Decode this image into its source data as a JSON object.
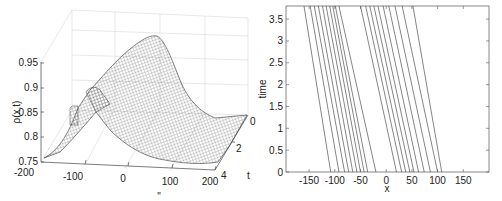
{
  "chart_data": [
    {
      "type": "surface",
      "title": "",
      "xlabel": "x",
      "ylabel": "t",
      "zlabel": "ρ(x,t)",
      "x_ticks": [
        "-200",
        "-100",
        "0",
        "100",
        "200"
      ],
      "t_ticks": [
        "0",
        "2",
        "4"
      ],
      "z_ticks": [
        "0.75",
        "0.8",
        "0.85",
        "0.9",
        "0.95"
      ],
      "xlim": [
        -200,
        200
      ],
      "tlim": [
        0,
        4
      ],
      "zlim": [
        0.75,
        0.95
      ],
      "description": "Mesh surface of density rho(x,t): a traveling hump with peak ~0.95 moving toward negative x as t increases; baseline ~0.75-0.78"
    },
    {
      "type": "line",
      "title": "",
      "xlabel": "x",
      "ylabel": "time",
      "xlim": [
        -195,
        200
      ],
      "ylim": [
        0,
        3.8
      ],
      "x_ticks": [
        "-150",
        "-100",
        "-50",
        "0",
        "50",
        "100",
        "150"
      ],
      "y_ticks": [
        "0",
        "0.5",
        "1",
        "1.5",
        "2",
        "2.5",
        "3",
        "3.5"
      ],
      "grid": false,
      "series": [
        {
          "name": "trajectory 1",
          "x": [
            -108,
            -160
          ],
          "t": [
            0,
            3.8
          ]
        },
        {
          "name": "trajectory 2",
          "x": [
            -92,
            -148
          ],
          "t": [
            0,
            3.8
          ]
        },
        {
          "name": "trajectory 3",
          "x": [
            -81,
            -140
          ],
          "t": [
            0,
            3.8
          ]
        },
        {
          "name": "trajectory 4",
          "x": [
            -73,
            -132
          ],
          "t": [
            0,
            3.8
          ]
        },
        {
          "name": "trajectory 5",
          "x": [
            -65,
            -124
          ],
          "t": [
            0,
            3.8
          ]
        },
        {
          "name": "trajectory 6",
          "x": [
            -57,
            -117
          ],
          "t": [
            0,
            3.8
          ]
        },
        {
          "name": "trajectory 7",
          "x": [
            -50,
            -110
          ],
          "t": [
            0,
            3.8
          ]
        },
        {
          "name": "trajectory 8",
          "x": [
            -43,
            -104
          ],
          "t": [
            0,
            3.8
          ]
        },
        {
          "name": "trajectory 9",
          "x": [
            -36,
            -99
          ],
          "t": [
            0,
            3.8
          ]
        },
        {
          "name": "trajectory 10",
          "x": [
            -20,
            -92
          ],
          "t": [
            0,
            3.8
          ]
        },
        {
          "name": "trajectory 11",
          "x": [
            20,
            -50
          ],
          "t": [
            0,
            3.8
          ]
        },
        {
          "name": "trajectory 12",
          "x": [
            30,
            -40
          ],
          "t": [
            0,
            3.8
          ]
        },
        {
          "name": "trajectory 13",
          "x": [
            38,
            -32
          ],
          "t": [
            0,
            3.8
          ]
        },
        {
          "name": "trajectory 14",
          "x": [
            46,
            -24
          ],
          "t": [
            0,
            3.8
          ]
        },
        {
          "name": "trajectory 15",
          "x": [
            54,
            -16
          ],
          "t": [
            0,
            3.8
          ]
        },
        {
          "name": "trajectory 16",
          "x": [
            63,
            -6
          ],
          "t": [
            0,
            3.8
          ]
        },
        {
          "name": "trajectory 17",
          "x": [
            74,
            5
          ],
          "t": [
            0,
            3.8
          ]
        },
        {
          "name": "trajectory 18",
          "x": [
            86,
            17
          ],
          "t": [
            0,
            3.8
          ]
        },
        {
          "name": "trajectory 19",
          "x": [
            100,
            31
          ],
          "t": [
            0,
            3.8
          ]
        },
        {
          "name": "trajectory 20",
          "x": [
            108,
            52
          ],
          "t": [
            0,
            3.8
          ]
        }
      ]
    }
  ]
}
